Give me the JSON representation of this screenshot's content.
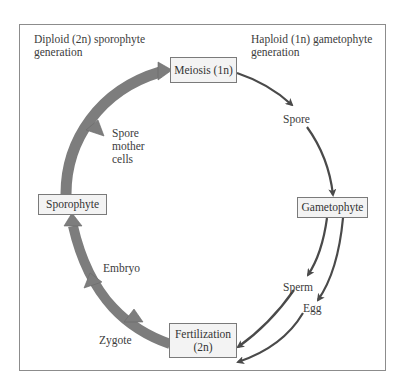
{
  "diagram": {
    "type": "life-cycle",
    "regions": {
      "diploid": {
        "line1": "Diploid (2n) sporophyte",
        "line2": "generation"
      },
      "haploid": {
        "line1": "Haploid (1n) gametophyte",
        "line2": "generation"
      }
    },
    "nodes": {
      "meiosis": "Meiosis (1n)",
      "gametophyte": "Gametophyte",
      "fertilization_line1": "Fertilization",
      "fertilization_line2": "(2n)",
      "sporophyte": "Sporophyte"
    },
    "labels": {
      "spore": "Spore",
      "sperm": "Sperm",
      "egg": "Egg",
      "zygote": "Zygote",
      "embryo": "Embryo",
      "spore_mother_line1": "Spore",
      "spore_mother_line2": "mother",
      "spore_mother_line3": "cells"
    },
    "edges": [
      {
        "from": "Meiosis (1n)",
        "to": "Spore",
        "style": "thin"
      },
      {
        "from": "Spore",
        "to": "Gametophyte",
        "style": "thin"
      },
      {
        "from": "Gametophyte",
        "to": "Sperm",
        "style": "thin"
      },
      {
        "from": "Gametophyte",
        "to": "Egg",
        "style": "thin"
      },
      {
        "from": "Sperm",
        "to": "Fertilization (2n)",
        "style": "thin"
      },
      {
        "from": "Egg",
        "to": "Fertilization (2n)",
        "style": "thin"
      },
      {
        "from": "Fertilization (2n)",
        "to": "Sporophyte",
        "style": "thick",
        "via": [
          "Zygote",
          "Embryo"
        ]
      },
      {
        "from": "Sporophyte",
        "to": "Meiosis (1n)",
        "style": "thick",
        "via": [
          "Spore mother cells"
        ]
      }
    ],
    "colors": {
      "thick_arrow": "#7d7d7d",
      "thin_arrow": "#4a4a4a",
      "box_fill": "#f3f3f3",
      "frame": "#8c8c8c"
    }
  }
}
